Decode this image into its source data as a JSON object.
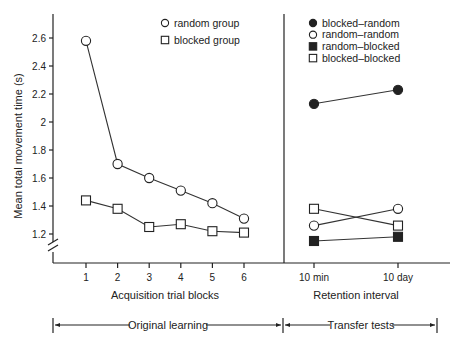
{
  "chart_data": {
    "type": "line",
    "title": "",
    "ylabel": "Mean total movement time (s)",
    "ylim": [
      1.1,
      2.7
    ],
    "yticks": [
      1.2,
      1.4,
      1.6,
      1.8,
      2,
      2.2,
      2.4,
      2.6
    ],
    "ytick_labels": [
      "1.2",
      "1.4",
      "1.6",
      "1.8",
      "2",
      "2.2",
      "2.4",
      "2.6"
    ],
    "y_axis_break": true,
    "grid": false,
    "panels": [
      {
        "name": "acquisition",
        "xlabel": "Acquisition trial blocks",
        "categories": [
          "1",
          "2",
          "3",
          "4",
          "5",
          "6"
        ],
        "legend_position": "top-left",
        "series": [
          {
            "name": "random group",
            "marker": "open-circle",
            "values": [
              2.58,
              1.7,
              1.6,
              1.51,
              1.42,
              1.31
            ]
          },
          {
            "name": "blocked group",
            "marker": "open-square",
            "values": [
              1.44,
              1.38,
              1.25,
              1.27,
              1.22,
              1.21
            ]
          }
        ]
      },
      {
        "name": "retention",
        "xlabel": "Retention interval",
        "categories": [
          "10 min",
          "10 day"
        ],
        "legend_position": "top-right",
        "series": [
          {
            "name": "blocked–random",
            "marker": "filled-circle",
            "values": [
              2.13,
              2.23
            ]
          },
          {
            "name": "random–random",
            "marker": "open-circle",
            "values": [
              1.26,
              1.38
            ]
          },
          {
            "name": "random–blocked",
            "marker": "filled-square",
            "values": [
              1.15,
              1.18
            ]
          },
          {
            "name": "blocked–blocked",
            "marker": "open-square",
            "values": [
              1.38,
              1.26
            ]
          }
        ]
      }
    ],
    "brackets": [
      {
        "label": "Original learning"
      },
      {
        "label": "Transfer tests"
      }
    ]
  },
  "colors": {
    "ink": "#222222",
    "line": "#333333",
    "background": "#ffffff"
  }
}
